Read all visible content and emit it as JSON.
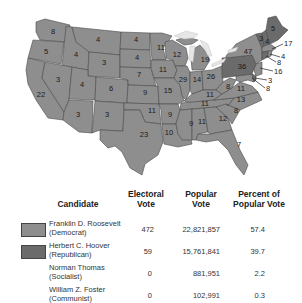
{
  "colors": {
    "democrat": "#8e8e8e",
    "republican": "#6b6b6b",
    "water": "#e6e6e6",
    "border": "#4a4a4a"
  },
  "map": {
    "title": "1932 Presidential Election — Electoral votes by state",
    "states": [
      {
        "abbr": "WA",
        "votes": "8",
        "party": "democrat"
      },
      {
        "abbr": "OR",
        "votes": "5",
        "party": "democrat"
      },
      {
        "abbr": "CA",
        "votes": "22",
        "party": "democrat"
      },
      {
        "abbr": "ID",
        "votes": "4",
        "party": "democrat"
      },
      {
        "abbr": "NV",
        "votes": "3",
        "party": "democrat"
      },
      {
        "abbr": "MT",
        "votes": "4",
        "party": "democrat"
      },
      {
        "abbr": "WY",
        "votes": "3",
        "party": "democrat"
      },
      {
        "abbr": "UT",
        "votes": "4",
        "party": "democrat"
      },
      {
        "abbr": "AZ",
        "votes": "3",
        "party": "democrat"
      },
      {
        "abbr": "CO",
        "votes": "6",
        "party": "democrat"
      },
      {
        "abbr": "NM",
        "votes": "3",
        "party": "democrat"
      },
      {
        "abbr": "ND",
        "votes": "4",
        "party": "democrat"
      },
      {
        "abbr": "SD",
        "votes": "4",
        "party": "democrat"
      },
      {
        "abbr": "NE",
        "votes": "7",
        "party": "democrat"
      },
      {
        "abbr": "KS",
        "votes": "9",
        "party": "democrat"
      },
      {
        "abbr": "OK",
        "votes": "11",
        "party": "democrat"
      },
      {
        "abbr": "TX",
        "votes": "23",
        "party": "democrat"
      },
      {
        "abbr": "MN",
        "votes": "11",
        "party": "democrat"
      },
      {
        "abbr": "IA",
        "votes": "11",
        "party": "democrat"
      },
      {
        "abbr": "MO",
        "votes": "15",
        "party": "democrat"
      },
      {
        "abbr": "AR",
        "votes": "9",
        "party": "democrat"
      },
      {
        "abbr": "LA",
        "votes": "10",
        "party": "democrat"
      },
      {
        "abbr": "WI",
        "votes": "12",
        "party": "democrat"
      },
      {
        "abbr": "IL",
        "votes": "29",
        "party": "democrat"
      },
      {
        "abbr": "MI",
        "votes": "19",
        "party": "democrat"
      },
      {
        "abbr": "IN",
        "votes": "14",
        "party": "democrat"
      },
      {
        "abbr": "OH",
        "votes": "26",
        "party": "democrat"
      },
      {
        "abbr": "KY",
        "votes": "11",
        "party": "democrat"
      },
      {
        "abbr": "TN",
        "votes": "11",
        "party": "democrat"
      },
      {
        "abbr": "MS",
        "votes": "9",
        "party": "democrat"
      },
      {
        "abbr": "AL",
        "votes": "11",
        "party": "democrat"
      },
      {
        "abbr": "GA",
        "votes": "12",
        "party": "democrat"
      },
      {
        "abbr": "FL",
        "votes": "7",
        "party": "democrat"
      },
      {
        "abbr": "SC",
        "votes": "8",
        "party": "democrat"
      },
      {
        "abbr": "NC",
        "votes": "13",
        "party": "democrat"
      },
      {
        "abbr": "VA",
        "votes": "11",
        "party": "democrat"
      },
      {
        "abbr": "WV",
        "votes": "8",
        "party": "democrat"
      },
      {
        "abbr": "PA",
        "votes": "36",
        "party": "republican"
      },
      {
        "abbr": "NY",
        "votes": "47",
        "party": "democrat"
      },
      {
        "abbr": "VT",
        "votes": "3",
        "party": "republican"
      },
      {
        "abbr": "NH",
        "votes": "4",
        "party": "republican"
      },
      {
        "abbr": "ME",
        "votes": "5",
        "party": "republican"
      },
      {
        "abbr": "MA",
        "votes": "17",
        "party": "democrat"
      },
      {
        "abbr": "RI",
        "votes": "4",
        "party": "democrat"
      },
      {
        "abbr": "CT",
        "votes": "8",
        "party": "republican"
      },
      {
        "abbr": "NJ",
        "votes": "16",
        "party": "democrat"
      },
      {
        "abbr": "DE",
        "votes": "3",
        "party": "republican"
      },
      {
        "abbr": "MD",
        "votes": "8",
        "party": "democrat"
      }
    ]
  },
  "legend": {
    "headers": {
      "candidate": "Candidate",
      "electoral_1": "Electoral",
      "electoral_2": "Vote",
      "popular_1": "Popular",
      "popular_2": "Vote",
      "percent_1": "Percent of",
      "percent_2": "Popular Vote"
    },
    "rows": [
      {
        "name": "Franklin D. Roosevelt",
        "party": "(Democrat)",
        "electoral": "472",
        "popular": "22,821,857",
        "percent": "57.4",
        "swatch": "democrat"
      },
      {
        "name": "Herbert C. Hoover",
        "party": "(Republican)",
        "electoral": "59",
        "popular": "15,761,841",
        "percent": "39.7",
        "swatch": "republican"
      },
      {
        "name": "Norman Thomas",
        "party": "(Socialist)",
        "electoral": "0",
        "popular": "881,951",
        "percent": "2.2",
        "swatch": null
      },
      {
        "name": "William Z. Foster",
        "party": "(Communist)",
        "electoral": "0",
        "popular": "102,991",
        "percent": "0.3",
        "swatch": null
      }
    ]
  }
}
